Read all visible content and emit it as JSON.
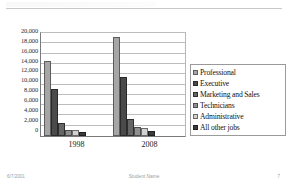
{
  "slide": {
    "footer": {
      "date": "6/7/2001",
      "name": "Student Name",
      "page": "7"
    }
  },
  "chart_data": {
    "type": "bar",
    "title": "",
    "xlabel": "",
    "ylabel": "",
    "categories": [
      "1998",
      "2008"
    ],
    "ylim": [
      0,
      20000
    ],
    "yticks": [
      "20,000",
      "18,000",
      "16,000",
      "14,000",
      "12,000",
      "10,000",
      "8,000",
      "6,000",
      "4,000",
      "2,000",
      "0"
    ],
    "ytick_values": [
      20000,
      18000,
      16000,
      14000,
      12000,
      10000,
      8000,
      6000,
      4000,
      2000,
      0
    ],
    "grid": true,
    "legend_position": "right",
    "series": [
      {
        "name": "Professional",
        "color": "#a6a6a6",
        "values": [
          14600,
          19200
        ]
      },
      {
        "name": "Executive",
        "color": "#4a4a4a",
        "values": [
          9200,
          11400
        ]
      },
      {
        "name": "Marketing and Sales",
        "color": "#656565",
        "values": [
          2600,
          3400
        ]
      },
      {
        "name": "Technicians",
        "color": "#8f8f8f",
        "values": [
          1200,
          1700
        ]
      },
      {
        "name": "Administrative",
        "color": "#d2d2d2",
        "values": [
          1100,
          1600
        ]
      },
      {
        "name": "All other jobs",
        "color": "#3b3b3b",
        "values": [
          700,
          900
        ]
      }
    ]
  }
}
